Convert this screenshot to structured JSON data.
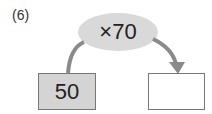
{
  "problem_number": "(6)",
  "operation": "×70",
  "input_value": "50",
  "output_value": "",
  "colors": {
    "ellipse": "#d9d9d9",
    "input_box": "#d4d4d4",
    "arrow": "#8a8a8a"
  }
}
